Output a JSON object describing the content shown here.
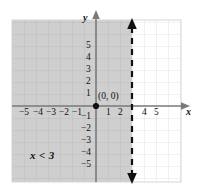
{
  "figure": {
    "kind": "cartesian-inequality-graph",
    "inequality_label": "x < 3",
    "origin_label": "(0, 0)",
    "axis_labels": {
      "x": "x",
      "y": "y"
    },
    "colors": {
      "shading": "#cfcfcf",
      "grid": "#bfbfbf",
      "grid_light": "#e2e2e2",
      "axis": "#808080",
      "boundary": "#111111",
      "point": "#111111",
      "background": "#ffffff"
    },
    "boundary": {
      "type": "dashed-vertical-line",
      "x_value": 3,
      "arrow_top": true,
      "arrow_bottom": true,
      "included": false
    },
    "shaded_side": "left",
    "grid": {
      "x_min": -7,
      "x_max": 7,
      "y_min": -7,
      "y_max": 7,
      "step": 1
    },
    "points": [
      {
        "label": "(0, 0)",
        "x": 0,
        "y": 0
      }
    ],
    "x_ticks": [
      {
        "value": -5,
        "label": "−5"
      },
      {
        "value": -4,
        "label": "−4"
      },
      {
        "value": -3,
        "label": "−3"
      },
      {
        "value": -2,
        "label": "−2"
      },
      {
        "value": -1,
        "label": "−1"
      },
      {
        "value": 1,
        "label": "1"
      },
      {
        "value": 2,
        "label": "2"
      },
      {
        "value": 4,
        "label": "4"
      },
      {
        "value": 5,
        "label": "5"
      }
    ],
    "y_ticks": [
      {
        "value": 5,
        "label": "5"
      },
      {
        "value": 4,
        "label": "4"
      },
      {
        "value": 3,
        "label": "3"
      },
      {
        "value": 2,
        "label": "2"
      },
      {
        "value": 1,
        "label": "1"
      },
      {
        "value": -1,
        "label": "−1"
      },
      {
        "value": -2,
        "label": "−2"
      },
      {
        "value": -3,
        "label": "−3"
      },
      {
        "value": -4,
        "label": "−4"
      },
      {
        "value": -5,
        "label": "−5"
      }
    ]
  }
}
